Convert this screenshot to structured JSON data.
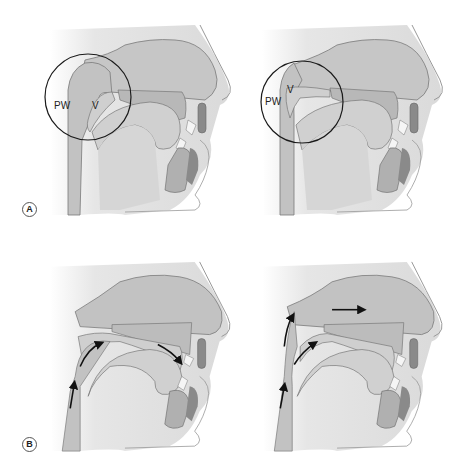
{
  "figure": {
    "rows": [
      {
        "label": "A",
        "description": "Velopharyngeal valve open vs closed (lateral view)"
      },
      {
        "label": "B",
        "description": "Airflow direction: oral vs nasal"
      }
    ],
    "panels": [
      {
        "id": "A-left",
        "row": "A",
        "circle": true,
        "labels": {
          "pw": "PW",
          "v": "V"
        },
        "velum": "closed",
        "arrows": []
      },
      {
        "id": "A-right",
        "row": "A",
        "circle": true,
        "labels": {
          "pw": "PW",
          "v": "V"
        },
        "velum": "open",
        "arrows": []
      },
      {
        "id": "B-left",
        "row": "B",
        "circle": false,
        "velum": "closed",
        "arrows": [
          "pharynx-up",
          "over-tongue",
          "toward-mouth"
        ]
      },
      {
        "id": "B-right",
        "row": "B",
        "circle": false,
        "velum": "open",
        "arrows": [
          "pharynx-up",
          "up-into-nasopharynx",
          "over-velum",
          "through-nose"
        ]
      }
    ]
  },
  "colors": {
    "background": "#ffffff",
    "tissue": "#c8c8c8",
    "tissue_dark": "#9a9a9a",
    "cavity": "#e2e2e2",
    "bone": "#b5b5b5",
    "outline": "#6a6a6a",
    "circle": "#1a1a1a",
    "arrow": "#111111"
  }
}
